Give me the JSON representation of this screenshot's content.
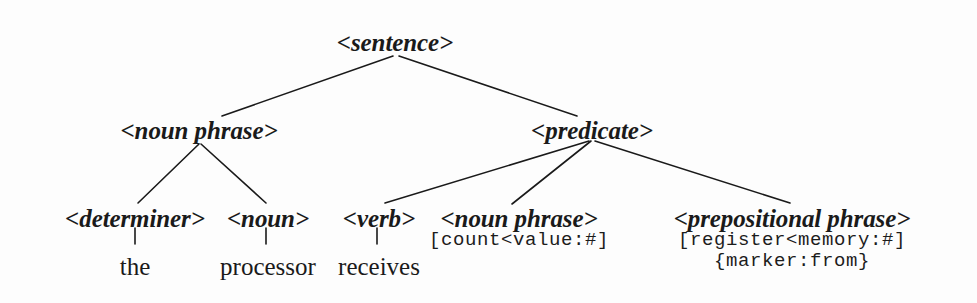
{
  "figure": {
    "type": "parse-tree",
    "background_color": "#fdfdfd",
    "ink_color": "#1a1a1a",
    "sentence_text": "the processor receives"
  },
  "nodes": {
    "sentence": {
      "label": "<sentence>",
      "x": 395,
      "y": 30
    },
    "noun_phrase_subject": {
      "label": "<noun phrase>",
      "x": 199,
      "y": 118
    },
    "predicate": {
      "label": "<predicate>",
      "x": 592,
      "y": 118
    },
    "determiner": {
      "label": "<determiner>",
      "x": 135,
      "y": 206
    },
    "noun": {
      "label": "<noun>",
      "x": 268,
      "y": 206
    },
    "verb": {
      "label": "<verb>",
      "x": 379,
      "y": 206
    },
    "noun_phrase_object": {
      "label": "<noun phrase>",
      "x": 519,
      "y": 206
    },
    "prepositional_phrase": {
      "label": "<prepositional phrase>",
      "x": 792,
      "y": 206
    }
  },
  "annotations": {
    "noun_phrase_object": {
      "lines": [
        "[count<value:#]"
      ],
      "x": 519,
      "y": 230
    },
    "prepositional_phrase": {
      "lines": [
        "[register<memory:#]",
        "{marker:from}"
      ],
      "x": 792,
      "y": 230
    }
  },
  "terminals": {
    "the": {
      "label": "the",
      "x": 135,
      "y": 254
    },
    "processor": {
      "label": "processor",
      "x": 268,
      "y": 254
    },
    "receives": {
      "label": "receives",
      "x": 379,
      "y": 254
    }
  },
  "edges": [
    {
      "from": "sentence",
      "to": "noun_phrase_subject",
      "x1": 393,
      "y1": 56,
      "x2": 222,
      "y2": 116
    },
    {
      "from": "sentence",
      "to": "predicate",
      "x1": 399,
      "y1": 56,
      "x2": 577,
      "y2": 116
    },
    {
      "from": "noun_phrase_subject",
      "to": "determiner",
      "x1": 199,
      "y1": 144,
      "x2": 138,
      "y2": 203
    },
    {
      "from": "noun_phrase_subject",
      "to": "noun",
      "x1": 201,
      "y1": 144,
      "x2": 266,
      "y2": 203
    },
    {
      "from": "predicate",
      "to": "verb",
      "x1": 589,
      "y1": 141,
      "x2": 385,
      "y2": 203
    },
    {
      "from": "predicate",
      "to": "noun_phrase_object",
      "x1": 591,
      "y1": 141,
      "x2": 512,
      "y2": 204
    },
    {
      "from": "predicate",
      "to": "prepositional_phrase",
      "x1": 595,
      "y1": 141,
      "x2": 790,
      "y2": 203
    },
    {
      "from": "determiner",
      "to": "the",
      "x1": 135,
      "y1": 228,
      "x2": 135,
      "y2": 244
    },
    {
      "from": "noun",
      "to": "processor",
      "x1": 266,
      "y1": 228,
      "x2": 266,
      "y2": 244
    },
    {
      "from": "verb",
      "to": "receives",
      "x1": 377,
      "y1": 228,
      "x2": 377,
      "y2": 244
    }
  ]
}
